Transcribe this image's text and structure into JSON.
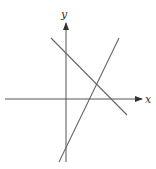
{
  "diagram": {
    "type": "coordinate-plane",
    "axes": {
      "x_label": "x",
      "y_label": "y",
      "origin_px": [
        66,
        99
      ],
      "x_axis": {
        "from": [
          5,
          99
        ],
        "to": [
          142,
          99
        ]
      },
      "y_axis": {
        "from": [
          66,
          162
        ],
        "to": [
          66,
          23
        ]
      },
      "color": "#555555"
    },
    "lines": [
      {
        "name": "decreasing-line",
        "from": [
          51,
          38
        ],
        "to": [
          127,
          115
        ],
        "color": "#666666"
      },
      {
        "name": "increasing-line",
        "from": [
          59,
          162
        ],
        "to": [
          119,
          38
        ],
        "color": "#666666"
      }
    ]
  }
}
